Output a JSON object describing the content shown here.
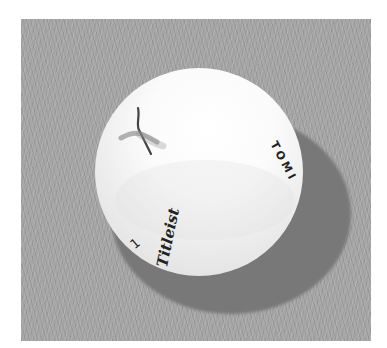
{
  "image": {
    "subject": "Golf ball resting on grass (grayscale illustration)",
    "colors": {
      "page_background": "#ffffff",
      "grass": "#a3a3a3",
      "shadow": "#7c7c7c",
      "ball": "#f4f4f4",
      "ink": "#222222"
    }
  },
  "ball": {
    "brand_text": "Titleist",
    "side_text": "TOMI",
    "number": "1"
  }
}
